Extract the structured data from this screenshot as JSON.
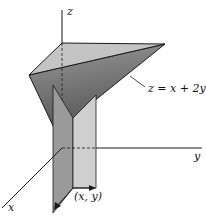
{
  "figure": {
    "axes": {
      "x_label": "x",
      "y_label": "y",
      "z_label": "z"
    },
    "surface_label": "z = x + 2y",
    "point_label": "(x, y)",
    "colors": {
      "top_face": "#c4c4c4",
      "slanted_plane": "#6e6e6e",
      "vertical_plane_left": "#9a9a9a",
      "vertical_plane_right": "#c8c8c8",
      "lines": "#1a1a1a"
    }
  }
}
